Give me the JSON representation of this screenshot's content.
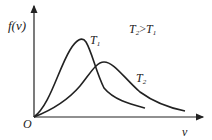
{
  "diagram": {
    "type": "maxwell-speed-distribution",
    "y_axis_label": "f(v)",
    "x_axis_label": "v",
    "origin_label": "O",
    "curves": [
      {
        "name": "T1",
        "label": "T",
        "sub": "1"
      },
      {
        "name": "T2",
        "label": "T",
        "sub": "2"
      }
    ],
    "relation": {
      "left": "T",
      "left_sub": "2",
      "op": ">",
      "right": "T",
      "right_sub": "1"
    },
    "colors": {
      "stroke": "#222222",
      "background": "#ffffff"
    }
  }
}
